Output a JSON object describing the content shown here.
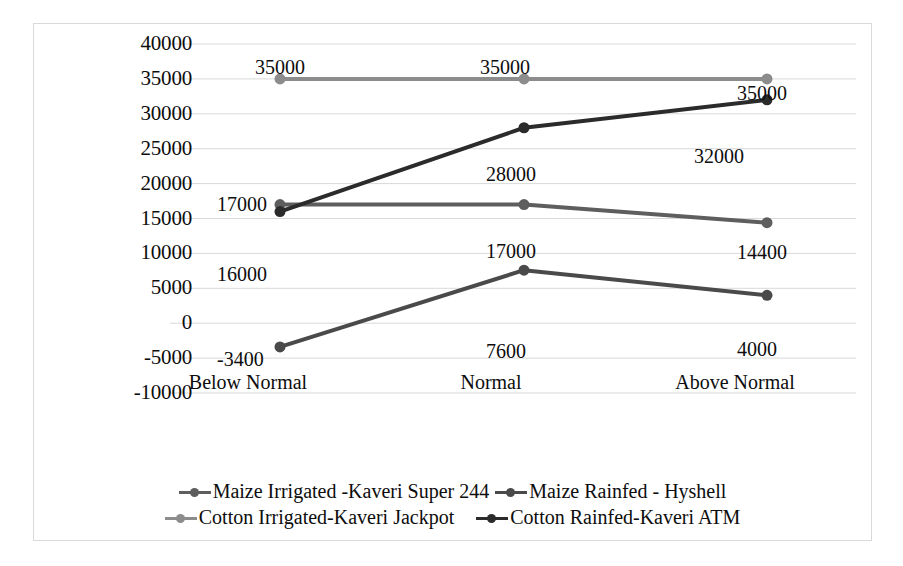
{
  "chart_data": {
    "type": "line",
    "title": "",
    "xlabel": "",
    "ylabel": "",
    "categories": [
      "Below Normal",
      "Normal",
      "Above Normal"
    ],
    "ylim": [
      -10000,
      40000
    ],
    "ytick_step": 5000,
    "yticks": [
      "40000",
      "35000",
      "30000",
      "25000",
      "20000",
      "15000",
      "10000",
      "5000",
      "0",
      "-5000",
      "-10000"
    ],
    "grid": true,
    "legend_position": "bottom",
    "series": [
      {
        "name": "Maize Irrigated -Kaveri Super 244",
        "color": "#5e5e5e",
        "values": [
          17000,
          17000,
          14400
        ],
        "labels": [
          "17000",
          "17000",
          "14400"
        ]
      },
      {
        "name": "Maize Rainfed - Hyshell",
        "color": "#4a4a4a",
        "values": [
          -3400,
          7600,
          4000
        ],
        "labels": [
          "-3400",
          "7600",
          "4000"
        ]
      },
      {
        "name": "Cotton Irrigated-Kaveri Jackpot",
        "color": "#8c8c8c",
        "values": [
          35000,
          35000,
          35000
        ],
        "labels": [
          "35000",
          "35000",
          "35000"
        ]
      },
      {
        "name": "Cotton Rainfed-Kaveri ATM",
        "color": "#2b2b2b",
        "values": [
          16000,
          28000,
          32000
        ],
        "labels": [
          "16000",
          "28000",
          "32000"
        ]
      }
    ]
  },
  "axis": {
    "y_labels": [
      "40000",
      "35000",
      "30000",
      "25000",
      "20000",
      "15000",
      "10000",
      "5000",
      "0",
      "-5000",
      "-10000"
    ],
    "x_labels": [
      "Below Normal",
      "Normal",
      "Above Normal"
    ]
  },
  "data_labels": [
    {
      "text": "35000",
      "x": 246,
      "y": 33,
      "align": "center"
    },
    {
      "text": "35000",
      "x": 471,
      "y": 33,
      "align": "center"
    },
    {
      "text": "35000",
      "x": 703,
      "y": 59,
      "align": "left"
    },
    {
      "text": "32000",
      "x": 660,
      "y": 122,
      "align": "left"
    },
    {
      "text": "28000",
      "x": 452,
      "y": 140,
      "align": "left"
    },
    {
      "text": "17000",
      "x": 183,
      "y": 170,
      "align": "left"
    },
    {
      "text": "17000",
      "x": 452,
      "y": 217,
      "align": "left"
    },
    {
      "text": "14400",
      "x": 703,
      "y": 218,
      "align": "left"
    },
    {
      "text": "16000",
      "x": 183,
      "y": 240,
      "align": "left"
    },
    {
      "text": "7600",
      "x": 452,
      "y": 317,
      "align": "left"
    },
    {
      "text": "-3400",
      "x": 183,
      "y": 325,
      "align": "left"
    },
    {
      "text": "4000",
      "x": 703,
      "y": 315,
      "align": "left"
    }
  ],
  "x_label_positions": [
    {
      "text": "Below Normal",
      "x": 214,
      "y": 348
    },
    {
      "text": "Normal",
      "x": 457,
      "y": 348
    },
    {
      "text": "Above Normal",
      "x": 701,
      "y": 348
    }
  ],
  "legend": {
    "rows": [
      [
        {
          "label": "Maize Irrigated -Kaveri Super 244",
          "color": "#5e5e5e"
        },
        {
          "label": "Maize Rainfed - Hyshell",
          "color": "#4a4a4a"
        }
      ],
      [
        {
          "label": "Cotton Irrigated-Kaveri Jackpot",
          "color": "#8c8c8c"
        },
        {
          "label": "Cotton Rainfed-Kaveri ATM",
          "color": "#2b2b2b"
        }
      ]
    ]
  },
  "style": {
    "gridline_color": "#d9d9d9",
    "border_color": "#d9d9d9",
    "background": "#ffffff",
    "text_color": "#0d0d0d"
  }
}
